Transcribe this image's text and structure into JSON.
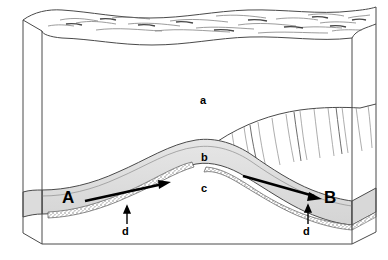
{
  "diagram": {
    "type": "block-diagram",
    "colors": {
      "outline": "#4a4a4a",
      "fill_background": "#ffffff",
      "layer_b_fill": "#dcdcdc",
      "layer_b_fill_light": "#e8e8e8",
      "stipple_d": "#777777",
      "arrow": "#000000",
      "text": "#000000"
    },
    "labels": [
      {
        "id": "a",
        "text": "a",
        "x": 203,
        "y": 100,
        "size": "small",
        "meaning": "upper rock unit"
      },
      {
        "id": "b",
        "text": "b",
        "x": 204,
        "y": 157,
        "size": "small",
        "meaning": "folded layer"
      },
      {
        "id": "c",
        "text": "c",
        "x": 204,
        "y": 188,
        "size": "small",
        "meaning": "lower rock unit"
      },
      {
        "id": "d-left",
        "text": "d",
        "x": 124,
        "y": 226,
        "size": "small",
        "meaning": "basal stippled bed (left limb)"
      },
      {
        "id": "d-right",
        "text": "d",
        "x": 305,
        "y": 226,
        "size": "small",
        "meaning": "basal stippled bed (right limb)"
      },
      {
        "id": "A",
        "text": "A",
        "x": 63,
        "y": 192,
        "size": "big",
        "meaning": "flow direction marker A"
      },
      {
        "id": "B",
        "text": "B",
        "x": 325,
        "y": 192,
        "size": "big",
        "meaning": "flow direction marker B"
      }
    ],
    "arrows": [
      {
        "id": "arrow-a",
        "from_label": "A",
        "direction": "right-up",
        "x1": 85,
        "y1": 200,
        "x2": 168,
        "y2": 183
      },
      {
        "id": "arrow-b",
        "from_label": "B",
        "direction": "right-down",
        "x1": 242,
        "y1": 177,
        "x2": 322,
        "y2": 199
      }
    ],
    "leaders": [
      {
        "id": "leader-d-left",
        "x": 127,
        "y_top": 211,
        "y_bottom": 224
      },
      {
        "id": "leader-d-right",
        "x": 308,
        "y_top": 210,
        "y_bottom": 224
      }
    ]
  }
}
